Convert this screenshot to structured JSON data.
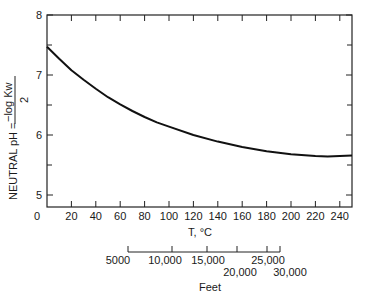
{
  "chart_data": {
    "type": "line",
    "title": "",
    "xlabel": "T, °C",
    "ylabel": "NEUTRAL pH = −log Kw / 2",
    "ylabel_parts": {
      "prefix": "NEUTRAL  pH =",
      "numerator": "−log Kw",
      "denominator": "2"
    },
    "xlim": [
      0,
      250
    ],
    "ylim": [
      4.8,
      8
    ],
    "x_ticks": [
      0,
      20,
      40,
      60,
      80,
      100,
      120,
      140,
      160,
      180,
      200,
      220,
      240
    ],
    "x_tick_labels": [
      "0",
      "20",
      "40",
      "60",
      "80",
      "100",
      "120",
      "140",
      "160",
      "180",
      "200",
      "220",
      "240"
    ],
    "y_ticks": [
      5,
      6,
      7,
      8
    ],
    "y_tick_labels": [
      "5",
      "6",
      "7",
      "8"
    ],
    "y_minor_ticks": [
      5.5,
      6.5,
      7.5
    ],
    "grid": false,
    "series": [
      {
        "name": "Neutral pH",
        "x": [
          0,
          10,
          20,
          25,
          30,
          40,
          50,
          60,
          70,
          80,
          90,
          100,
          120,
          140,
          160,
          180,
          200,
          220,
          230,
          240,
          250
        ],
        "y": [
          7.47,
          7.27,
          7.08,
          7.0,
          6.92,
          6.77,
          6.63,
          6.51,
          6.4,
          6.3,
          6.21,
          6.14,
          6.0,
          5.89,
          5.8,
          5.73,
          5.68,
          5.65,
          5.64,
          5.65,
          5.66
        ]
      }
    ],
    "secondary_axis": {
      "label": "Feet",
      "tick_labels_upper": [
        "5000",
        "10,000",
        "15,000",
        "25,000"
      ],
      "tick_labels_lower": [
        "20,000",
        "30,000"
      ],
      "ticks": [
        5000,
        10000,
        15000,
        20000,
        25000,
        30000
      ]
    }
  }
}
